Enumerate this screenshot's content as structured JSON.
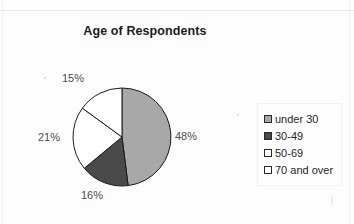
{
  "chart_data": {
    "type": "pie",
    "title": "Age of Respondents",
    "categories": [
      "under 30",
      "30-49",
      "50-69",
      "70 and over"
    ],
    "values": [
      48,
      16,
      21,
      15
    ],
    "value_labels": [
      "48%",
      "16%",
      "21%",
      "15%"
    ],
    "unit": "%",
    "start_angle_deg": 0,
    "direction": "clockwise",
    "legend_position": "right",
    "grid": false,
    "xlabel": "",
    "ylabel": "",
    "slice_colors": [
      "#a8a8a8",
      "#4a4a4a",
      "#ffffff",
      "#ffffff"
    ],
    "slice_outline_color": "#1a1a1a",
    "label_color": "#4d4d4d",
    "title_color": "#1c1c1c"
  },
  "legend": {
    "entries": [
      {
        "label": "under 30",
        "swatch_name": "legend-swatch-under-30",
        "color": "#a8a8a8"
      },
      {
        "label": "30-49",
        "swatch_name": "legend-swatch-30-49",
        "color": "#4a4a4a"
      },
      {
        "label": "50-69",
        "swatch_name": "legend-swatch-50-69",
        "color": "#ffffff"
      },
      {
        "label": "70 and over",
        "swatch_name": "legend-swatch-70-and-over",
        "color": "#ffffff"
      }
    ]
  },
  "canvas": {
    "background": "#fdfdfd",
    "pie_center_x": 122,
    "pie_center_y": 137,
    "pie_radius": 49
  }
}
